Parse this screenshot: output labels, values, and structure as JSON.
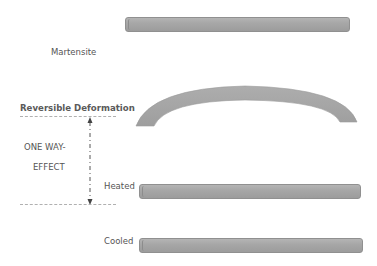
{
  "diagram": {
    "title_labels": {
      "martensite": "Martensite",
      "reversible_deformation": "Reversible Deformation",
      "one_way_line1": "ONE WAY-",
      "one_way_line2": "EFFECT",
      "heated": "Heated",
      "cooled": "Cooled"
    },
    "elements": [
      {
        "id": "martensite-bar",
        "shape": "straight-bar",
        "state": "Martensite"
      },
      {
        "id": "deformed-arc",
        "shape": "curved-arc",
        "state": "Reversible Deformation"
      },
      {
        "id": "heated-bar",
        "shape": "straight-bar",
        "state": "Heated"
      },
      {
        "id": "cooled-bar",
        "shape": "straight-bar",
        "state": "Cooled"
      }
    ],
    "colors": {
      "bar_fill": "#a8a8a8",
      "bar_edge": "#909090",
      "text": "#555555",
      "dash_line": "#b0b0b0",
      "arrow": "#444444"
    }
  }
}
